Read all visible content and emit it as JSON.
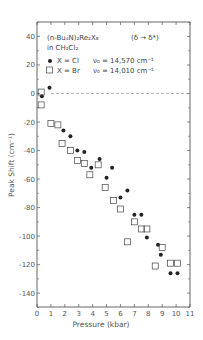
{
  "chart_data": {
    "type": "scatter",
    "annotation": "(δ → δ*)",
    "xlabel": "Pressure (kbar)",
    "ylabel": "Peak Shift (cm⁻¹)",
    "xlim": [
      0,
      11
    ],
    "ylim": [
      -150,
      50
    ],
    "xticks": [
      0,
      1,
      2,
      3,
      4,
      5,
      6,
      7,
      8,
      9,
      10,
      11
    ],
    "yticks": [
      40,
      20,
      0,
      -20,
      -40,
      -60,
      -80,
      -100,
      -120,
      -140
    ],
    "reference_line": {
      "y": 0,
      "style": "dashed"
    },
    "grid": false,
    "legend_position": "upper-left inside",
    "series": [
      {
        "name": "X = Cl",
        "marker": "filled-circle",
        "nu0": "ν0 = 14,570 cm⁻¹",
        "points": [
          [
            0.35,
            -2
          ],
          [
            0.9,
            4
          ],
          [
            1.9,
            -26
          ],
          [
            2.4,
            -30
          ],
          [
            2.9,
            -40
          ],
          [
            3.4,
            -41
          ],
          [
            3.9,
            -52
          ],
          [
            4.5,
            -46
          ],
          [
            5.0,
            -59
          ],
          [
            5.4,
            -52
          ],
          [
            6.0,
            -73
          ],
          [
            6.5,
            -68
          ],
          [
            7.0,
            -85
          ],
          [
            7.5,
            -85
          ],
          [
            7.9,
            -101
          ],
          [
            8.7,
            -106
          ],
          [
            8.9,
            -113
          ],
          [
            9.6,
            -126
          ],
          [
            10.1,
            -126
          ]
        ]
      },
      {
        "name": "X = Br",
        "marker": "open-square",
        "nu0": "ν0 = 14,010 cm⁻¹",
        "points": [
          [
            0.3,
            1
          ],
          [
            0.3,
            -8
          ],
          [
            1.0,
            -21
          ],
          [
            1.5,
            -22
          ],
          [
            1.8,
            -35
          ],
          [
            2.4,
            -40
          ],
          [
            2.9,
            -47
          ],
          [
            3.4,
            -49
          ],
          [
            3.8,
            -57
          ],
          [
            4.4,
            -50
          ],
          [
            4.9,
            -66
          ],
          [
            5.5,
            -75
          ],
          [
            6.0,
            -81
          ],
          [
            6.5,
            -104
          ],
          [
            7.0,
            -90
          ],
          [
            7.5,
            -95
          ],
          [
            7.9,
            -95
          ],
          [
            8.5,
            -121
          ],
          [
            9.0,
            -108
          ],
          [
            9.6,
            -119
          ],
          [
            10.1,
            -119
          ]
        ]
      }
    ]
  },
  "legend": {
    "title_line1": "(n-Bu₄N)₂Re₂X₈",
    "title_line2": "in CH₂Cl₂",
    "transition": "(δ → δ*)",
    "cl_label": "X = Cl",
    "cl_nu": "ν₀ = 14,570 cm⁻¹",
    "br_label": "X = Br",
    "br_nu": "ν₀ = 14,010 cm⁻¹"
  },
  "axes": {
    "xlabel": "Pressure   (kbar)",
    "ylabel": "Peak Shift  (cm⁻¹)"
  },
  "colors": {
    "axis": "#555555",
    "marker": "#222222",
    "dashed": "#888888"
  }
}
